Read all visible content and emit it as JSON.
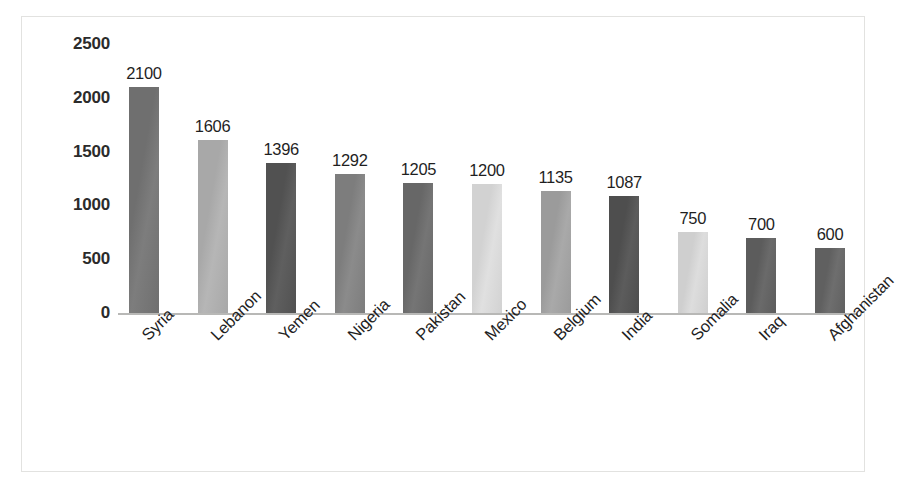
{
  "chart_data": {
    "type": "bar",
    "title": "",
    "subtitle": "",
    "xlabel": "",
    "ylabel": "",
    "categories": [
      "Syria",
      "Lebanon",
      "Yemen",
      "Nigeria",
      "Pakistan",
      "Mexico",
      "Belgium",
      "India",
      "Somalia",
      "Iraq",
      "Afghanistan"
    ],
    "values": [
      2100,
      1606,
      1396,
      1292,
      1205,
      1200,
      1135,
      1087,
      750,
      700,
      600
    ],
    "value_labels": [
      "2100",
      "1606",
      "1396",
      "1292",
      "1205",
      "1200",
      "1135",
      "1087",
      "750",
      "700",
      "600"
    ],
    "bar_colors": [
      "#6f6f6f",
      "#a8a8a8",
      "#515151",
      "#7d7d7d",
      "#676767",
      "#d2d2d2",
      "#9b9b9b",
      "#4e4e4e",
      "#cfcfcf",
      "#5c5c5c",
      "#606060"
    ],
    "ylim": [
      0,
      2500
    ],
    "yticks": [
      0,
      500,
      1000,
      1500,
      2000,
      2500
    ],
    "ytick_labels": [
      "0",
      "500",
      "1000",
      "1500",
      "2000",
      "2500"
    ],
    "grid": false,
    "legend": "none",
    "data_labels_shown": true,
    "x_label_rotation": -45,
    "axis_line_color": "#b8b8b6",
    "frame_color": "#e2e2e0",
    "background_color": "#ffffff",
    "tick_label_color": "#2b2b2b",
    "value_label_color": "#1f1f1f"
  }
}
